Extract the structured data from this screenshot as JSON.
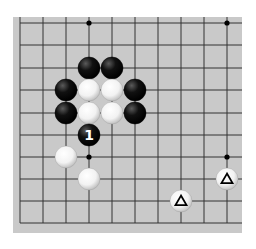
{
  "diagram": {
    "board_color": "#c9c9c9",
    "line_color": "#333333",
    "grid": {
      "columns": 10,
      "rows": 10,
      "x": [
        20,
        43,
        66,
        89,
        112,
        135,
        158,
        181,
        204,
        227
      ],
      "y": [
        23,
        45,
        68,
        90,
        113,
        135,
        157,
        179,
        201,
        223
      ],
      "open_top": true,
      "open_right": true
    },
    "star_points": [
      {
        "col": 3,
        "row": 0
      },
      {
        "col": 9,
        "row": 0
      },
      {
        "col": 3,
        "row": 6
      },
      {
        "col": 9,
        "row": 6
      }
    ],
    "stones": [
      {
        "color": "black",
        "col": 3,
        "row": 2
      },
      {
        "color": "black",
        "col": 4,
        "row": 2
      },
      {
        "color": "black",
        "col": 2,
        "row": 3
      },
      {
        "color": "white",
        "col": 3,
        "row": 3
      },
      {
        "color": "white",
        "col": 4,
        "row": 3
      },
      {
        "color": "black",
        "col": 5,
        "row": 3
      },
      {
        "color": "black",
        "col": 2,
        "row": 4
      },
      {
        "color": "white",
        "col": 3,
        "row": 4
      },
      {
        "color": "white",
        "col": 4,
        "row": 4
      },
      {
        "color": "black",
        "col": 5,
        "row": 4
      },
      {
        "color": "black",
        "col": 3,
        "row": 5,
        "label": "1"
      },
      {
        "color": "white",
        "col": 2,
        "row": 6
      },
      {
        "color": "white",
        "col": 3,
        "row": 7
      },
      {
        "color": "white",
        "col": 9,
        "row": 7,
        "mark": "triangle"
      },
      {
        "color": "white",
        "col": 7,
        "row": 8,
        "mark": "triangle"
      }
    ]
  }
}
